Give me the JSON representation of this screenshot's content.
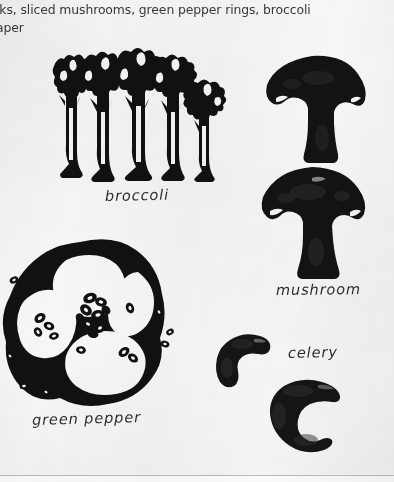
{
  "page": {
    "background_color": "#f7f7f5",
    "ink_color": "#111111"
  },
  "caption": {
    "line1": "lks, sliced mushrooms, green pepper rings, broccoli",
    "line2": "aper"
  },
  "labels": {
    "broccoli": "broccoli",
    "mushroom": "mushroom",
    "green_pepper": "green pepper",
    "celery": "celery"
  },
  "illustrations": [
    {
      "name": "broccoli-illustration",
      "subject": "broccoli",
      "style": "black-silhouette-line-drawing",
      "description": "cluster of five broccoli spears drawn as tree-like shapes with branching florets and thick stalks"
    },
    {
      "name": "mushroom-slice-illustration-top",
      "subject": "mushroom",
      "style": "solid-black-silhouette",
      "description": "sliced mushroom showing domed cap and central stem"
    },
    {
      "name": "mushroom-slice-illustration-bottom",
      "subject": "mushroom",
      "style": "solid-black-silhouette",
      "description": "second sliced mushroom showing domed cap and central stem"
    },
    {
      "name": "green-pepper-ring-illustration",
      "subject": "green pepper",
      "style": "thick-black-outline",
      "description": "green pepper ring cut crosswise with four lobes, central seed cluster and loose seeds scattered around"
    },
    {
      "name": "celery-slice-illustration-top",
      "subject": "celery",
      "style": "solid-black-silhouette",
      "description": "crescent shaped slice of celery stalk"
    },
    {
      "name": "celery-slice-illustration-bottom",
      "subject": "celery",
      "style": "solid-black-silhouette",
      "description": "larger crescent shaped slice of celery stalk"
    }
  ]
}
